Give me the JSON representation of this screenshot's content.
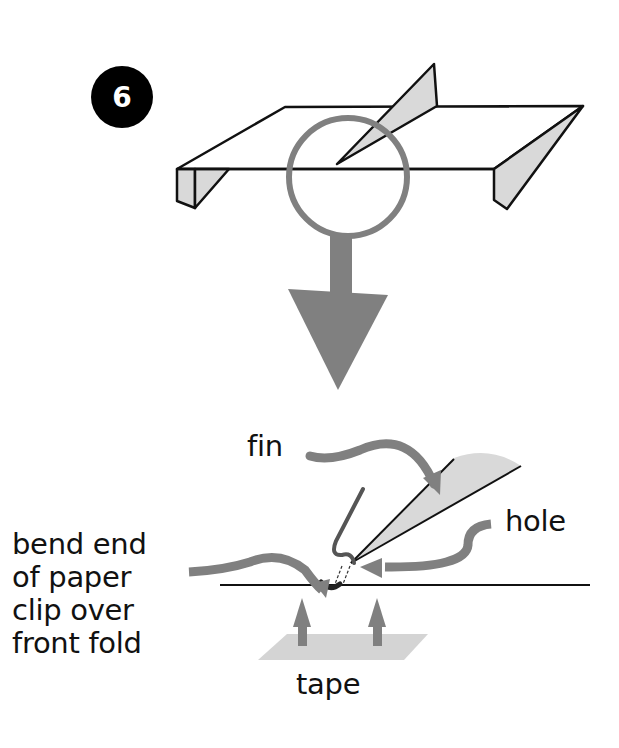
{
  "step": {
    "number": "6",
    "badge_color": "#000000"
  },
  "colors": {
    "outline": "#111111",
    "fin_fill": "#d9d9d9",
    "arrow_gray": "#808080",
    "tape_fill": "#d4d4d4"
  },
  "labels": {
    "fin": "fin",
    "hole": "hole",
    "bend": [
      "bend end",
      "of paper",
      "clip over",
      "front fold"
    ],
    "tape": "tape"
  }
}
